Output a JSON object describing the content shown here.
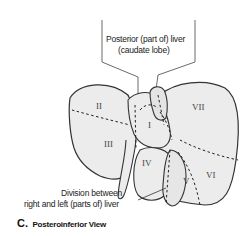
{
  "figure": {
    "view_letter": "C.",
    "view_title": "Posteroinferior View",
    "callouts": {
      "caudate_line1": "Posterior (part of) liver",
      "caudate_line2": "(caudate lobe)",
      "division_line1": "Division between",
      "division_line2": "right and left (parts of) liver"
    },
    "segments": {
      "I": "I",
      "II": "II",
      "III": "III",
      "IV": "IV",
      "V": "V",
      "VI": "VI",
      "VII": "VII"
    },
    "colors": {
      "outline": "#333333",
      "fill": "#ececec",
      "shade": "#d9d9d9",
      "text": "#222222"
    }
  }
}
